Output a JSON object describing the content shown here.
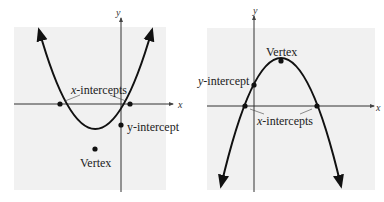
{
  "figures": [
    {
      "name": "upward-parabola",
      "axes": {
        "x": "x",
        "y": "y"
      },
      "labels": {
        "x_intercepts": "x-intercepts",
        "y_intercept": "y-intercept",
        "vertex": "Vertex"
      },
      "x_prefix": "x",
      "x_suffix": "-intercepts",
      "y_prefix": "y",
      "y_suffix": "-intercept"
    },
    {
      "name": "downward-parabola",
      "axes": {
        "x": "x",
        "y": "y"
      },
      "labels": {
        "x_intercepts": "x-intercepts",
        "y_intercept": "y-intercept",
        "vertex": "Vertex"
      },
      "x_prefix": "x",
      "x_suffix": "-intercepts",
      "y_prefix": "y",
      "y_suffix": "-intercept"
    }
  ],
  "colors": {
    "panel_bg": "#f1f1f1",
    "curve": "#111111",
    "axis": "#333333"
  }
}
